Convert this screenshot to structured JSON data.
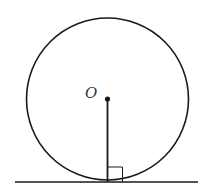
{
  "diagram": {
    "center_label": "O",
    "colors": {
      "stroke": "#1a1a1a",
      "background": "#ffffff",
      "label": "#333333"
    },
    "circle": {
      "cx": 107.5,
      "cy": 99,
      "r": 81
    },
    "tangent_line": {
      "x1": 15,
      "y1": 182,
      "x2": 198,
      "y2": 182
    },
    "radius_segment": {
      "x1": 107.5,
      "y1": 99,
      "x2": 107.5,
      "y2": 182
    },
    "right_angle_marker": {
      "x": 107.5,
      "y": 167,
      "size": 15
    }
  }
}
